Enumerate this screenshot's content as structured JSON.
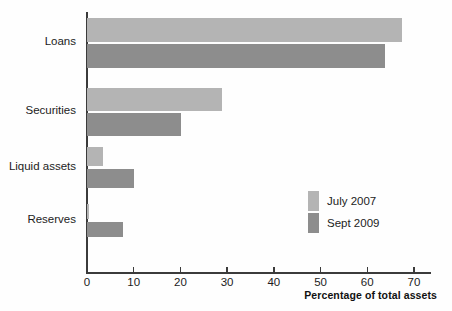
{
  "chart_data": {
    "type": "bar",
    "orientation": "horizontal",
    "title": "",
    "subtitle": "",
    "xlabel": "Percentage of total assets",
    "ylabel": "",
    "categories": [
      "Loans",
      "Securities",
      "Liquid assets",
      "Reserves"
    ],
    "series": [
      {
        "name": "July 2007",
        "color": "#b4b4b4",
        "values": [
          67.4,
          28.8,
          3.4,
          0.5
        ]
      },
      {
        "name": "Sept 2009",
        "color": "#8d8d8d",
        "values": [
          63.8,
          20.2,
          10.1,
          7.6
        ]
      }
    ],
    "xlim": [
      0,
      73
    ],
    "xticks": [
      0,
      10,
      20,
      30,
      40,
      50,
      60,
      70
    ],
    "xtick_labels": [
      "0",
      "10",
      "20",
      "30",
      "40",
      "50",
      "60",
      "70"
    ],
    "grid": false,
    "legend_position": "inside-right-lower",
    "legend": [
      "July 2007",
      "Sept 2009"
    ],
    "annotations": []
  },
  "colors": {
    "series_light": "#b4b4b4",
    "series_dark": "#8d8d8d",
    "axis": "#3b3b3b",
    "text": "#1c1c1c",
    "background": "#fefefe"
  }
}
